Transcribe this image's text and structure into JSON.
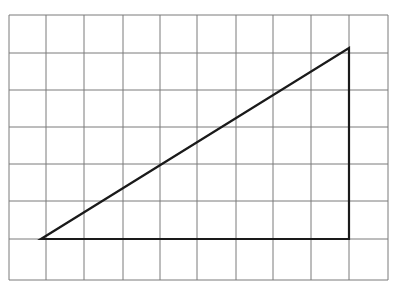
{
  "diagram": {
    "type": "grid-with-right-triangle",
    "colors": {
      "background": "#ffffff",
      "grid_line": "#7a7a7a",
      "triangle_stroke": "#1a1a1a"
    },
    "grid": {
      "columns": 10,
      "rows": 7,
      "x_lines": [
        9,
        46,
        84,
        123,
        160,
        197,
        236,
        273,
        311,
        349,
        388
      ],
      "y_lines": [
        15,
        53,
        90,
        127,
        164,
        201,
        239,
        280
      ]
    },
    "triangle": {
      "vertices": [
        {
          "name": "bottom-left",
          "x": 41,
          "y": 239
        },
        {
          "name": "bottom-right",
          "x": 349,
          "y": 239
        },
        {
          "name": "top-right",
          "x": 349,
          "y": 48
        }
      ],
      "base_units": 8,
      "height_units": 5
    }
  }
}
